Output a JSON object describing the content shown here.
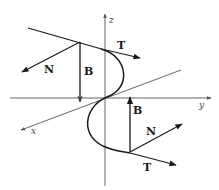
{
  "diagram": {
    "axes": {
      "x": "x",
      "y": "y",
      "z": "z"
    },
    "frame_upper": {
      "tangent": "T",
      "normal": "N",
      "binormal": "B"
    },
    "frame_lower": {
      "tangent": "T",
      "normal": "N",
      "binormal": "B"
    },
    "colors": {
      "stroke": "#1a1a1a",
      "axis": "#555555",
      "background": "#ffffff"
    }
  }
}
